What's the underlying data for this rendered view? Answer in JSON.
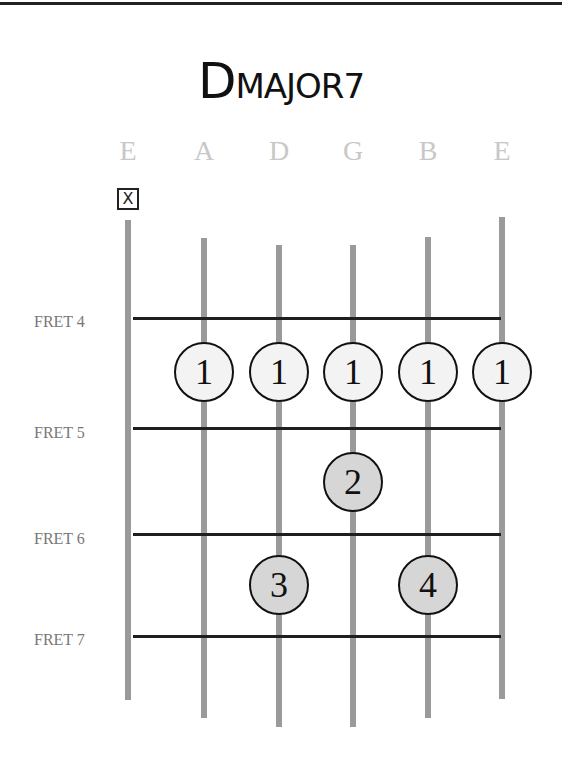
{
  "title": {
    "first": "D",
    "rest": "MAJOR7"
  },
  "strings": [
    {
      "name": "E",
      "x": 128,
      "top": 220,
      "bottom": 700
    },
    {
      "name": "A",
      "x": 204,
      "top": 238,
      "bottom": 718
    },
    {
      "name": "D",
      "x": 279,
      "top": 245,
      "bottom": 727
    },
    {
      "name": "G",
      "x": 353,
      "top": 245,
      "bottom": 727
    },
    {
      "name": "B",
      "x": 428,
      "top": 237,
      "bottom": 718
    },
    {
      "name": "E",
      "x": 502,
      "top": 217,
      "bottom": 699
    }
  ],
  "muted_marker": "X",
  "frets": [
    {
      "label": "FRET 4",
      "y": 318
    },
    {
      "label": "FRET 5",
      "y": 428
    },
    {
      "label": "FRET 6",
      "y": 534
    },
    {
      "label": "FRET 7",
      "y": 636
    }
  ],
  "fingers": [
    {
      "string": "A",
      "finger": "1",
      "x": 204,
      "y": 372,
      "style": "open"
    },
    {
      "string": "D",
      "finger": "1",
      "x": 279,
      "y": 372,
      "style": "open"
    },
    {
      "string": "G",
      "finger": "1",
      "x": 353,
      "y": 372,
      "style": "open"
    },
    {
      "string": "B",
      "finger": "1",
      "x": 428,
      "y": 372,
      "style": "open"
    },
    {
      "string": "E",
      "finger": "1",
      "x": 502,
      "y": 372,
      "style": "open"
    },
    {
      "string": "G",
      "finger": "2",
      "x": 353,
      "y": 482,
      "style": "fill"
    },
    {
      "string": "D",
      "finger": "3",
      "x": 279,
      "y": 585,
      "style": "fill"
    },
    {
      "string": "B",
      "finger": "4",
      "x": 428,
      "y": 585,
      "style": "fill"
    }
  ]
}
